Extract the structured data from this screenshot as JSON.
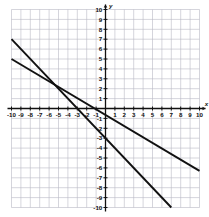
{
  "chart_data": {
    "type": "line",
    "title": "",
    "xlabel": "x",
    "ylabel": "y",
    "xlim": [
      -10,
      10
    ],
    "ylim": [
      -10,
      10
    ],
    "grid": true,
    "legend": "none",
    "x_ticks": [
      -10,
      -9,
      -8,
      -7,
      -6,
      -5,
      -4,
      -3,
      -2,
      -1,
      1,
      2,
      3,
      4,
      5,
      6,
      7,
      8,
      9,
      10
    ],
    "y_ticks": [
      10,
      9,
      8,
      7,
      6,
      5,
      4,
      3,
      2,
      1,
      -1,
      -2,
      -3,
      -4,
      -5,
      -6,
      -7,
      -8,
      -9,
      -10
    ],
    "x_tick_labels": [
      "-10",
      "-9",
      "-8",
      "-7",
      "-6",
      "-5",
      "-4",
      "-3",
      "-2",
      "-1",
      "1",
      "2",
      "3",
      "4",
      "5",
      "6",
      "7",
      "8",
      "9",
      "10"
    ],
    "y_tick_labels": [
      "10",
      "9",
      "8",
      "7",
      "6",
      "5",
      "4",
      "3",
      "2",
      "1",
      "-1",
      "-2",
      "-3",
      "-4",
      "-5",
      "-6",
      "-7",
      "-8",
      "-9",
      "-10"
    ],
    "series": [
      {
        "name": "line-1",
        "slope": -1.0,
        "intercept": -3.0,
        "color": "#111111",
        "points": [
          [
            -10,
            7
          ],
          [
            7,
            -10
          ]
        ]
      },
      {
        "name": "line-2",
        "slope": -0.565,
        "intercept": -0.65,
        "color": "#111111",
        "points": [
          [
            -10,
            5
          ],
          [
            10,
            -6.3
          ]
        ]
      }
    ],
    "intersection": [
      -5.4,
      2.4
    ],
    "grid_color": "#b9b9c4",
    "axis_color": "#111111"
  }
}
